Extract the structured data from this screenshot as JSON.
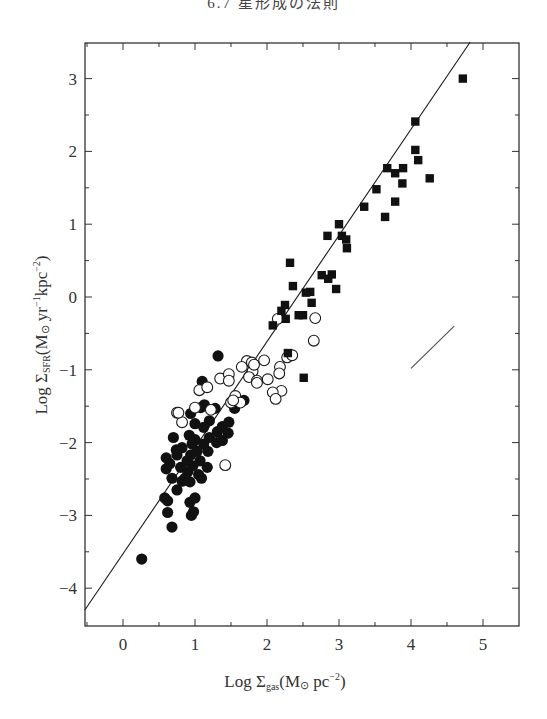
{
  "page": {
    "header": "6.7 星形成の法則"
  },
  "chart_data": {
    "type": "scatter",
    "title": "",
    "xlabel": "Log Σgas (M⊙ pc⁻²)",
    "ylabel": "Log ΣSFR (M⊙ yr⁻¹ kpc⁻²)",
    "xlabel_parts": {
      "main": "Log Σ",
      "sub": "gas",
      "unit": "(M",
      "sun": "⊙",
      "unit2": " pc",
      "sup": "−2",
      "close": ")"
    },
    "ylabel_parts": {
      "main": "Log Σ",
      "sub": "SFR",
      "unit": "(M",
      "sun": "⊙",
      "unit2": " yr",
      "sup1": "−1",
      "unit3": "kpc",
      "sup2": "−2",
      "close": ")"
    },
    "xlim": [
      -0.55,
      5.5
    ],
    "ylim": [
      -4.55,
      3.5
    ],
    "x_ticks": [
      0,
      1,
      2,
      3,
      4,
      5
    ],
    "x_tick_labels": [
      "0",
      "1",
      "2",
      "3",
      "4",
      "5"
    ],
    "x_minor_ticks": [
      -0.5,
      0.5,
      1.5,
      2.5,
      3.5,
      4.5
    ],
    "y_ticks": [
      3,
      2,
      1,
      0,
      -1,
      -2,
      -3,
      -4
    ],
    "y_tick_labels": [
      "3",
      "2",
      "1",
      "0",
      "−1",
      "−2",
      "−3",
      "−4"
    ],
    "y_minor_ticks": [
      2.5,
      1.5,
      0.5,
      -0.5,
      -1.5,
      -2.5,
      -3.5
    ],
    "grid": false,
    "legend": null,
    "fit_line": {
      "label": "Schmidt law fit, N = 1.4",
      "x": [
        -0.53,
        4.82
      ],
      "y": [
        -4.3,
        3.5
      ]
    },
    "slope_reference_segment": {
      "label": "slope 1",
      "x": [
        4.0,
        4.6
      ],
      "y": [
        -0.98,
        -0.4
      ]
    },
    "series": [
      {
        "name": "normal disk galaxies (filled circles)",
        "marker": "filled-circle",
        "points": [
          [
            0.26,
            -3.6
          ],
          [
            0.68,
            -3.16
          ],
          [
            0.62,
            -2.96
          ],
          [
            0.95,
            -3.0
          ],
          [
            0.93,
            -2.82
          ],
          [
            1.0,
            -2.76
          ],
          [
            0.62,
            -2.8
          ],
          [
            0.82,
            -2.53
          ],
          [
            0.93,
            -2.54
          ],
          [
            0.58,
            -2.76
          ],
          [
            0.75,
            -2.65
          ],
          [
            0.86,
            -2.49
          ],
          [
            1.09,
            -2.49
          ],
          [
            0.68,
            -2.49
          ],
          [
            0.9,
            -2.4
          ],
          [
            1.05,
            -2.44
          ],
          [
            0.6,
            -2.36
          ],
          [
            0.8,
            -2.34
          ],
          [
            0.97,
            -2.32
          ],
          [
            1.17,
            -2.34
          ],
          [
            0.65,
            -2.29
          ],
          [
            0.89,
            -2.25
          ],
          [
            1.07,
            -2.25
          ],
          [
            0.75,
            -2.17
          ],
          [
            0.94,
            -2.17
          ],
          [
            0.6,
            -2.21
          ],
          [
            0.82,
            -2.07
          ],
          [
            1.03,
            -2.12
          ],
          [
            1.18,
            -2.12
          ],
          [
            0.74,
            -2.1
          ],
          [
            0.96,
            -2.02
          ],
          [
            1.12,
            -2.02
          ],
          [
            0.92,
            -1.9
          ],
          [
            1.2,
            -1.93
          ],
          [
            0.7,
            -1.93
          ],
          [
            1.31,
            -1.85
          ],
          [
            1.12,
            -1.79
          ],
          [
            1.38,
            -1.78
          ],
          [
            1.0,
            -1.74
          ],
          [
            1.47,
            -1.72
          ],
          [
            0.94,
            -1.6
          ],
          [
            1.2,
            -1.7
          ],
          [
            1.08,
            -1.52
          ],
          [
            1.28,
            -1.53
          ],
          [
            1.13,
            -1.48
          ],
          [
            1.55,
            -1.53
          ],
          [
            1.68,
            -1.42
          ],
          [
            1.1,
            -1.16
          ],
          [
            1.32,
            -0.81
          ],
          [
            0.98,
            -2.95
          ],
          [
            1.3,
            -2.0
          ],
          [
            1.38,
            -1.97
          ],
          [
            1.46,
            -1.87
          ],
          [
            1.0,
            -1.96
          ]
        ]
      },
      {
        "name": "intermediate galaxies (open circles)",
        "marker": "open-circle",
        "points": [
          [
            0.75,
            -1.59
          ],
          [
            0.82,
            -1.72
          ],
          [
            0.77,
            -1.59
          ],
          [
            1.0,
            -1.52
          ],
          [
            1.22,
            -1.55
          ],
          [
            1.06,
            -1.28
          ],
          [
            1.17,
            -1.24
          ],
          [
            1.35,
            -1.12
          ],
          [
            1.47,
            -1.06
          ],
          [
            1.47,
            -1.15
          ],
          [
            1.56,
            -1.36
          ],
          [
            1.8,
            -1.02
          ],
          [
            1.72,
            -0.88
          ],
          [
            1.65,
            -0.96
          ],
          [
            1.75,
            -1.1
          ],
          [
            1.86,
            -1.15
          ],
          [
            1.79,
            -0.9
          ],
          [
            1.82,
            -0.93
          ],
          [
            2.01,
            -1.13
          ],
          [
            1.96,
            -0.87
          ],
          [
            2.18,
            -0.96
          ],
          [
            2.17,
            -1.05
          ],
          [
            2.2,
            -1.29
          ],
          [
            2.28,
            -0.83
          ],
          [
            2.35,
            -0.8
          ],
          [
            2.08,
            -1.31
          ],
          [
            2.12,
            -1.4
          ],
          [
            1.86,
            -1.18
          ],
          [
            1.5,
            -1.45
          ],
          [
            1.63,
            -1.45
          ],
          [
            1.42,
            -2.31
          ],
          [
            2.15,
            -0.3
          ],
          [
            2.67,
            -0.29
          ],
          [
            2.65,
            -0.6
          ],
          [
            1.53,
            -1.42
          ]
        ]
      },
      {
        "name": "starburst galaxies (filled squares)",
        "marker": "filled-square",
        "points": [
          [
            4.72,
            3.0
          ],
          [
            4.06,
            2.41
          ],
          [
            4.06,
            2.02
          ],
          [
            4.1,
            1.88
          ],
          [
            4.26,
            1.63
          ],
          [
            3.89,
            1.77
          ],
          [
            3.67,
            1.77
          ],
          [
            3.78,
            1.7
          ],
          [
            3.88,
            1.56
          ],
          [
            3.52,
            1.48
          ],
          [
            3.78,
            1.31
          ],
          [
            3.35,
            1.24
          ],
          [
            3.64,
            1.1
          ],
          [
            3.04,
            0.84
          ],
          [
            3.1,
            0.79
          ],
          [
            3.0,
            1.0
          ],
          [
            3.11,
            0.67
          ],
          [
            2.84,
            0.84
          ],
          [
            2.32,
            0.47
          ],
          [
            2.76,
            0.3
          ],
          [
            2.9,
            0.31
          ],
          [
            2.85,
            0.25
          ],
          [
            2.36,
            0.15
          ],
          [
            2.96,
            0.11
          ],
          [
            2.54,
            0.06
          ],
          [
            2.6,
            0.07
          ],
          [
            2.62,
            -0.08
          ],
          [
            2.25,
            -0.11
          ],
          [
            2.2,
            -0.19
          ],
          [
            2.44,
            -0.25
          ],
          [
            2.26,
            -0.3
          ],
          [
            2.08,
            -0.39
          ],
          [
            2.51,
            -1.11
          ],
          [
            2.29,
            -0.77
          ],
          [
            2.5,
            -0.25
          ]
        ]
      }
    ]
  },
  "colors": {
    "ink": "#1a1a1a",
    "axis": "#333333",
    "marker_fill": "#111111",
    "open_fill": "#ffffff"
  }
}
